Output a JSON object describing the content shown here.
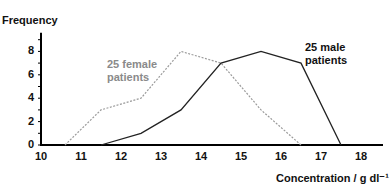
{
  "chart_data": {
    "type": "line",
    "title": "",
    "xlabel": "Concentration / g dl⁻¹",
    "ylabel": "Frequency",
    "xlim": [
      10,
      18.5
    ],
    "ylim": [
      0,
      9.5
    ],
    "x_ticks": [
      "10",
      "11",
      "12",
      "13",
      "14",
      "15",
      "16",
      "17",
      "18"
    ],
    "y_ticks": [
      "0",
      "2",
      "4",
      "6",
      "8"
    ],
    "grid": false,
    "legend": "inline annotations",
    "series": [
      {
        "name": "25 female patients",
        "style": "dotted grey",
        "color": "#9a9a9a",
        "x": [
          10.6,
          11.5,
          12.5,
          13.5,
          14.5,
          15.5,
          16.5
        ],
        "values": [
          0,
          3,
          4,
          8,
          7,
          3,
          0
        ]
      },
      {
        "name": "25 male patients",
        "style": "solid black",
        "color": "#222222",
        "x": [
          11.5,
          12.5,
          13.5,
          14.5,
          15.5,
          16.5,
          17.5
        ],
        "values": [
          0,
          1,
          3,
          7,
          8,
          7,
          0
        ]
      }
    ],
    "annotations": [
      {
        "text_line1": "25 female",
        "text_line2": "patients"
      },
      {
        "text_line1": "25 male",
        "text_line2": "patients"
      }
    ]
  }
}
